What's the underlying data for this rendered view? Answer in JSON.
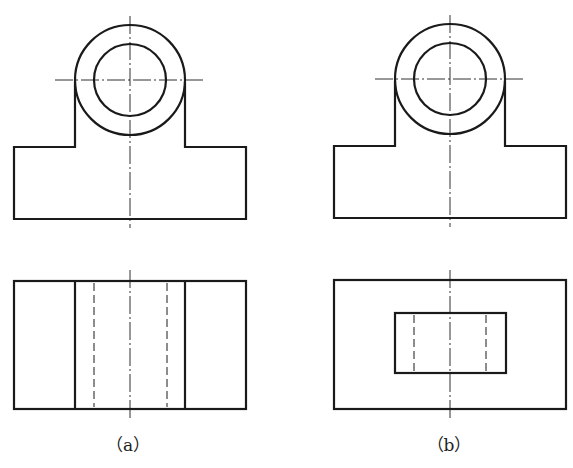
{
  "figure": {
    "views": [
      {
        "id": "a",
        "label": "（a）",
        "front_view": "circle boss on rectangular base",
        "top_view": "rectangle with two solid lines and two hidden (dashed) lines"
      },
      {
        "id": "b",
        "label": "（b）",
        "front_view": "circle boss on rectangular base",
        "top_view": "rectangle with inner rectangle and two hidden (dashed) lines"
      }
    ],
    "line_color": "#1a1a1a",
    "background": "#ffffff"
  }
}
